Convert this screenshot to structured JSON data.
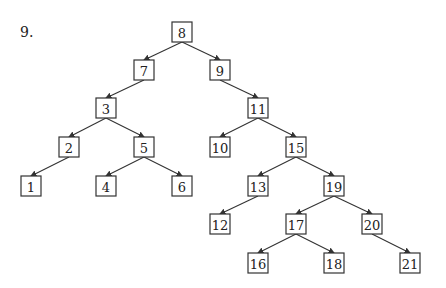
{
  "problem_label": "9.",
  "tree": {
    "nodes": [
      {
        "id": "8",
        "x": 182,
        "y": 32
      },
      {
        "id": "7",
        "x": 144,
        "y": 70
      },
      {
        "id": "9",
        "x": 220,
        "y": 70
      },
      {
        "id": "3",
        "x": 106,
        "y": 108
      },
      {
        "id": "11",
        "x": 258,
        "y": 108
      },
      {
        "id": "2",
        "x": 69,
        "y": 147
      },
      {
        "id": "5",
        "x": 144,
        "y": 147
      },
      {
        "id": "10",
        "x": 220,
        "y": 147
      },
      {
        "id": "15",
        "x": 296,
        "y": 147
      },
      {
        "id": "1",
        "x": 31,
        "y": 186
      },
      {
        "id": "4",
        "x": 106,
        "y": 186
      },
      {
        "id": "6",
        "x": 182,
        "y": 186
      },
      {
        "id": "13",
        "x": 258,
        "y": 186
      },
      {
        "id": "19",
        "x": 334,
        "y": 186
      },
      {
        "id": "12",
        "x": 220,
        "y": 224
      },
      {
        "id": "17",
        "x": 296,
        "y": 224
      },
      {
        "id": "20",
        "x": 372,
        "y": 224
      },
      {
        "id": "16",
        "x": 258,
        "y": 263
      },
      {
        "id": "18",
        "x": 334,
        "y": 263
      },
      {
        "id": "21",
        "x": 410,
        "y": 263
      }
    ],
    "edges": [
      [
        "8",
        "7"
      ],
      [
        "8",
        "9"
      ],
      [
        "7",
        "3"
      ],
      [
        "9",
        "11"
      ],
      [
        "3",
        "2"
      ],
      [
        "3",
        "5"
      ],
      [
        "11",
        "10"
      ],
      [
        "11",
        "15"
      ],
      [
        "2",
        "1"
      ],
      [
        "5",
        "4"
      ],
      [
        "5",
        "6"
      ],
      [
        "15",
        "13"
      ],
      [
        "15",
        "19"
      ],
      [
        "13",
        "12"
      ],
      [
        "19",
        "17"
      ],
      [
        "19",
        "20"
      ],
      [
        "17",
        "16"
      ],
      [
        "17",
        "18"
      ],
      [
        "20",
        "21"
      ]
    ]
  }
}
